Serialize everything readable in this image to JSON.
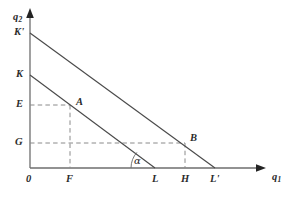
{
  "figure": {
    "type": "line-diagram",
    "background_color": "#ffffff",
    "line_color": "#4a4a4a",
    "axis_color": "#6e6e6e",
    "dash_color": "#8a8a8a",
    "text_color": "#2b2b2b",
    "axes": {
      "x": {
        "label": "q",
        "label_subscript": "1",
        "start": [
          30,
          168
        ],
        "end": [
          265,
          168
        ],
        "arrow": true
      },
      "y": {
        "label": "q",
        "label_subscript": "2",
        "start": [
          30,
          168
        ],
        "end": [
          30,
          12
        ],
        "arrow": true
      },
      "origin_label": "0"
    },
    "lines": [
      {
        "name": "outer-budget-line",
        "from_label": "K'",
        "to_label": "L'",
        "from": [
          30,
          33
        ],
        "to": [
          215,
          168
        ]
      },
      {
        "name": "inner-budget-line",
        "from_label": "K",
        "to_label": "L",
        "from": [
          30,
          75
        ],
        "to": [
          155,
          168
        ]
      }
    ],
    "points": [
      {
        "name": "point-a",
        "label": "A",
        "x": 70,
        "y": 105,
        "on_line": "inner-budget-line",
        "y_axis_label": "E",
        "x_axis_label": "F"
      },
      {
        "name": "point-b",
        "label": "B",
        "x": 185,
        "y": 143,
        "on_line": "outer-budget-line",
        "y_axis_label": "G",
        "x_axis_label": "H"
      }
    ],
    "y_axis_ticks": [
      {
        "label": "K'",
        "y": 33
      },
      {
        "label": "K",
        "y": 75
      },
      {
        "label": "E",
        "y": 105
      },
      {
        "label": "G",
        "y": 143
      }
    ],
    "x_axis_ticks": [
      {
        "label": "0",
        "x": 30
      },
      {
        "label": "F",
        "x": 70
      },
      {
        "label": "L",
        "x": 155
      },
      {
        "label": "H",
        "x": 185
      },
      {
        "label": "L'",
        "x": 215
      }
    ],
    "angle": {
      "name": "alpha-angle",
      "label": "α",
      "vertex_label": "L",
      "vertex": [
        155,
        168
      ],
      "opens_toward": "x-axis-left"
    }
  }
}
